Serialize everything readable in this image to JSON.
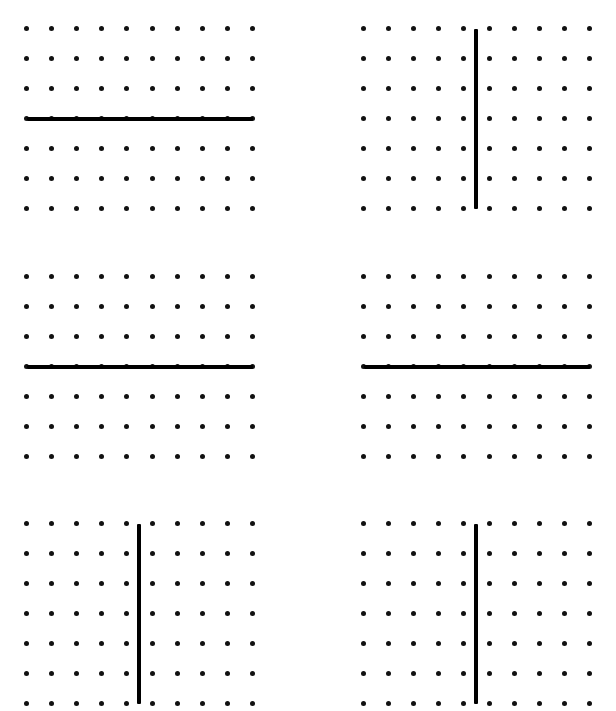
{
  "figure": {
    "width": 616,
    "height": 711,
    "background_color": "#ffffff",
    "panel_count": 6,
    "panel_columns": 2,
    "panel_rows": 3
  },
  "grid_spec": {
    "dot_columns": 10,
    "dot_rows": 7,
    "dot_diameter_px": 5,
    "dot_color": "#111111",
    "column_spacing_px": 24.1,
    "row_spacing_px": 28.3,
    "line_color": "#000000",
    "line_thickness_px": 4
  },
  "panels": [
    {
      "id": "panel-1",
      "position": "top-left",
      "left": 24,
      "top": 26,
      "width": 231,
      "height": 185,
      "line": {
        "orientation": "horizontal",
        "label": "horizontal-line",
        "row_index": 4,
        "column_index": null,
        "offset_px": 0,
        "spans_full_extent": true
      }
    },
    {
      "id": "panel-2",
      "position": "top-right",
      "left": 361,
      "top": 26,
      "width": 231,
      "height": 185,
      "line": {
        "orientation": "vertical",
        "label": "vertical-line",
        "row_index": null,
        "column_index": 5,
        "offset_px": 12,
        "spans_full_extent": true
      }
    },
    {
      "id": "panel-3",
      "position": "middle-left",
      "left": 24,
      "top": 274,
      "width": 231,
      "height": 185,
      "line": {
        "orientation": "horizontal",
        "label": "horizontal-line",
        "row_index": 4,
        "column_index": null,
        "offset_px": 0,
        "spans_full_extent": true
      }
    },
    {
      "id": "panel-4",
      "position": "middle-right",
      "left": 361,
      "top": 274,
      "width": 231,
      "height": 185,
      "line": {
        "orientation": "horizontal",
        "label": "horizontal-line",
        "row_index": 4,
        "column_index": null,
        "offset_px": 0,
        "spans_full_extent": true
      }
    },
    {
      "id": "panel-5",
      "position": "bottom-left",
      "left": 24,
      "top": 521,
      "width": 231,
      "height": 185,
      "line": {
        "orientation": "vertical",
        "label": "vertical-line",
        "row_index": null,
        "column_index": 5,
        "offset_px": 12,
        "spans_full_extent": true
      }
    },
    {
      "id": "panel-6",
      "position": "bottom-right",
      "left": 361,
      "top": 521,
      "width": 231,
      "height": 185,
      "line": {
        "orientation": "vertical",
        "label": "vertical-line",
        "row_index": null,
        "column_index": 5,
        "offset_px": 12,
        "spans_full_extent": true
      }
    }
  ]
}
